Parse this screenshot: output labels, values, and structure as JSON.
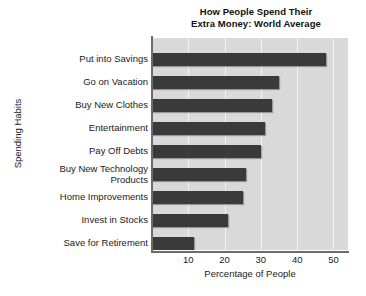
{
  "chart_data": {
    "type": "bar",
    "orientation": "horizontal",
    "title": "How People Spend Their Extra Money: World Average",
    "title_lines": [
      "How People Spend Their",
      "Extra Money: World Average"
    ],
    "xlabel": "Percentage of People",
    "ylabel": "Spending Habits",
    "categories": [
      "Put into Savings",
      "Go on Vacation",
      "Buy New Clothes",
      "Entertainment",
      "Pay Off Debts",
      "Buy New Technology\nProducts",
      "Home Improvements",
      "Invest in Stocks",
      "Save for Retirement"
    ],
    "values": [
      48,
      35,
      33,
      31,
      30,
      26,
      25,
      21,
      11.5
    ],
    "xlim": [
      0,
      54
    ],
    "xticks": [
      10,
      20,
      30,
      40,
      50
    ],
    "xtick_labels": [
      "10",
      "20",
      "30",
      "40",
      "50"
    ],
    "grid": "vertical",
    "legend": "none",
    "bar_color": "#3a3a3a",
    "plot_background": "#d9d9d9",
    "gridline_color": "#f2f2f2",
    "axis_color": "#6b6b6b",
    "page_background": "#ffffff"
  }
}
